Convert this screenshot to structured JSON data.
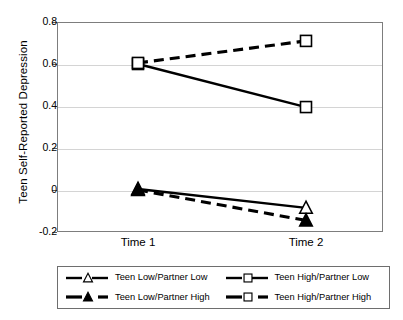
{
  "chart_data": {
    "type": "line",
    "title": "",
    "subtitle": "",
    "xlabel": "",
    "ylabel": "Teen Self-Reported Depression",
    "categories": [
      "Time 1",
      "Time 2"
    ],
    "x": [
      0,
      1
    ],
    "ylim": [
      -0.2,
      0.8
    ],
    "yticks": [
      0.8,
      0.6,
      0.4,
      0.2,
      0,
      -0.2
    ],
    "ytick_labels": [
      "0.8",
      "0.6",
      "0.4",
      "0.2",
      "0",
      "-0.2"
    ],
    "grid": "horizontal",
    "legend_position": "bottom",
    "series": [
      {
        "name": "Teen Low/Partner Low",
        "values": [
          0.005,
          -0.085
        ],
        "marker": "open-triangle",
        "linestyle": "solid",
        "color": "#000000"
      },
      {
        "name": "Teen Low/Partner High",
        "values": [
          0.0,
          -0.145
        ],
        "marker": "filled-triangle",
        "linestyle": "dashed",
        "color": "#000000"
      },
      {
        "name": "Teen High/Partner Low",
        "values": [
          0.6,
          0.395
        ],
        "marker": "open-square",
        "linestyle": "solid",
        "color": "#000000"
      },
      {
        "name": "Teen High/Partner High",
        "values": [
          0.605,
          0.71
        ],
        "marker": "open-square",
        "linestyle": "dashed",
        "color": "#000000"
      }
    ],
    "colors": {
      "line": "#000000",
      "grid": "#d4d4d4",
      "axis": "#7d7d7d",
      "background": "#ffffff",
      "marker_fill": "#ffffff"
    }
  },
  "legend": {
    "entries": [
      {
        "label": "Teen Low/Partner Low",
        "marker": "open-triangle",
        "linestyle": "solid"
      },
      {
        "label": "Teen High/Partner Low",
        "marker": "open-square",
        "linestyle": "solid"
      },
      {
        "label": "Teen Low/Partner High",
        "marker": "filled-triangle",
        "linestyle": "dashed"
      },
      {
        "label": "Teen High/Partner High",
        "marker": "open-square",
        "linestyle": "dashed"
      }
    ]
  }
}
